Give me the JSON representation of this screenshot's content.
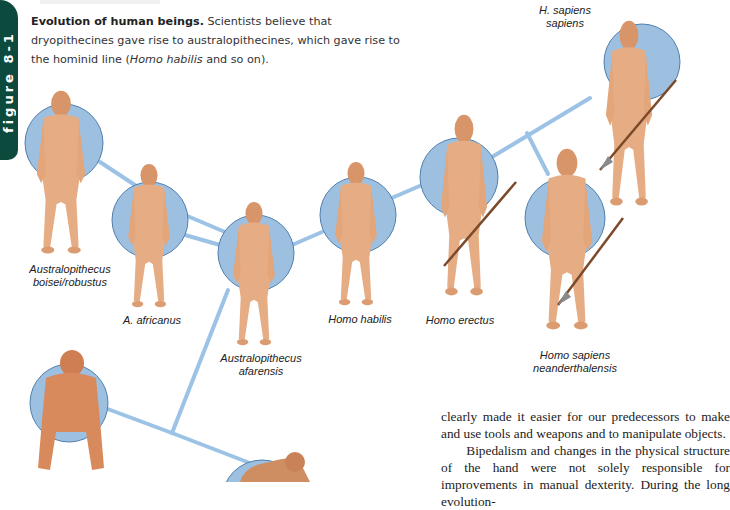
{
  "sidebar_tab": {
    "label": "figure 8-1",
    "color": "#0d4a3e"
  },
  "caption": {
    "title": "Evolution of human beings.",
    "text_parts": [
      " Scientists believe that dryopithecines gave rise to australopithecines, which gave rise to the hominid line (",
      "Homo habilis",
      " and so on)."
    ]
  },
  "diagram": {
    "circle_color": "#9dbfe0",
    "circle_stroke": "#4f7fae",
    "line_color": "#9cc3e6",
    "figure_color": "#e0a77a",
    "species": [
      {
        "id": "dryopithecine-left",
        "label": ""
      },
      {
        "id": "dryopithecine-bottom",
        "label": ""
      },
      {
        "id": "boisei-robustus",
        "label_line1": "Australopithecus",
        "label_line2": "boisei/robustus"
      },
      {
        "id": "africanus",
        "label_line1": "A. africanus"
      },
      {
        "id": "afarensis",
        "label_line1": "Australopithecus",
        "label_line2": "afarensis"
      },
      {
        "id": "habilis",
        "label_line1": "Homo habilis"
      },
      {
        "id": "erectus",
        "label_line1": "Homo erectus"
      },
      {
        "id": "neanderthalensis",
        "label_line1": "Homo sapiens",
        "label_line2": "neanderthalensis"
      },
      {
        "id": "sapiens-sapiens",
        "label_line1": "H. sapiens",
        "label_line2": "sapiens"
      }
    ]
  },
  "body_text": {
    "para1": "clearly made it easier for our predecessors to make and use tools and weapons and to manipulate objects.",
    "para2": "Bipedalism and changes in the physical structure of the hand were not solely responsible for improvements in manual dexterity. During the long evolution-"
  }
}
